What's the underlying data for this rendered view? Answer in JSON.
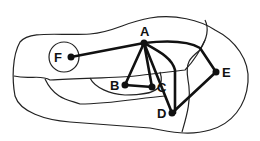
{
  "diagram": {
    "type": "graph-over-map",
    "nodes": [
      {
        "id": "A",
        "label": "A",
        "x": 144,
        "y": 43
      },
      {
        "id": "B",
        "label": "B",
        "x": 125,
        "y": 85
      },
      {
        "id": "C",
        "label": "C",
        "x": 152,
        "y": 87
      },
      {
        "id": "D",
        "label": "D",
        "x": 172,
        "y": 113
      },
      {
        "id": "E",
        "label": "E",
        "x": 216,
        "y": 72
      },
      {
        "id": "F",
        "label": "F",
        "x": 71,
        "y": 57
      }
    ],
    "edges": [
      [
        "A",
        "F"
      ],
      [
        "A",
        "B"
      ],
      [
        "A",
        "C"
      ],
      [
        "A",
        "D"
      ],
      [
        "B",
        "C"
      ],
      [
        "A",
        "D",
        "curved-right"
      ],
      [
        "A",
        "E"
      ],
      [
        "E",
        "D"
      ]
    ],
    "colors": {
      "ink": "#111111",
      "background": "#ffffff"
    }
  }
}
